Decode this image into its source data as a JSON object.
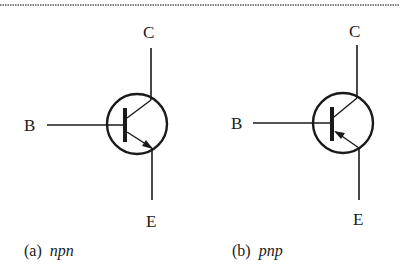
{
  "figure": {
    "border_style": "dashed-top-rule",
    "colors": {
      "ink": "#1a1a1a",
      "background": "#ffffff"
    },
    "transistors": [
      {
        "id": "npn",
        "type": "npn",
        "terminals": {
          "collector": "C",
          "base": "B",
          "emitter": "E"
        },
        "arrow_direction": "outward-on-emitter",
        "caption_prefix": "(a)",
        "caption_type": "npn"
      },
      {
        "id": "pnp",
        "type": "pnp",
        "terminals": {
          "collector": "C",
          "base": "B",
          "emitter": "E"
        },
        "arrow_direction": "inward-on-emitter",
        "caption_prefix": "(b)",
        "caption_type": "pnp"
      }
    ]
  }
}
